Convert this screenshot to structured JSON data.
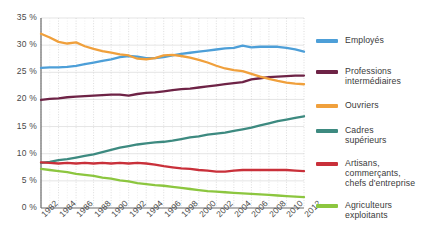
{
  "chart_data": {
    "type": "line",
    "title": "",
    "subtitle": "",
    "xlabel": "",
    "ylabel": "",
    "xlim": [
      1982,
      2012
    ],
    "ylim": [
      0,
      35
    ],
    "grid": true,
    "legend_position": "right",
    "y_ticks": [
      {
        "value": 0,
        "label": "0 %"
      },
      {
        "value": 5,
        "label": "5 %"
      },
      {
        "value": 10,
        "label": "10 %"
      },
      {
        "value": 15,
        "label": "15 %"
      },
      {
        "value": 20,
        "label": "20 %"
      },
      {
        "value": 25,
        "label": "25 %"
      },
      {
        "value": 30,
        "label": "30 %"
      },
      {
        "value": 35,
        "label": "35 %"
      }
    ],
    "x_ticks": [
      {
        "value": 1982,
        "label": "1982"
      },
      {
        "value": 1984,
        "label": "1984"
      },
      {
        "value": 1986,
        "label": "1986"
      },
      {
        "value": 1988,
        "label": "1988"
      },
      {
        "value": 1990,
        "label": "1990"
      },
      {
        "value": 1992,
        "label": "1992"
      },
      {
        "value": 1994,
        "label": "1994"
      },
      {
        "value": 1996,
        "label": "1996"
      },
      {
        "value": 1998,
        "label": "1998"
      },
      {
        "value": 2000,
        "label": "2000"
      },
      {
        "value": 2002,
        "label": "2002"
      },
      {
        "value": 2004,
        "label": "2004"
      },
      {
        "value": 2006,
        "label": "2006"
      },
      {
        "value": 2008,
        "label": "2008"
      },
      {
        "value": 2010,
        "label": "2010"
      },
      {
        "value": 2012,
        "label": "2012"
      }
    ],
    "x": [
      1982,
      1983,
      1984,
      1985,
      1986,
      1987,
      1988,
      1989,
      1990,
      1991,
      1992,
      1993,
      1994,
      1995,
      1996,
      1997,
      1998,
      1999,
      2000,
      2001,
      2002,
      2003,
      2004,
      2005,
      2006,
      2007,
      2008,
      2009,
      2010,
      2011,
      2012
    ],
    "series": [
      {
        "name": "Employés",
        "color": "#4d9fd8",
        "values": [
          25.8,
          25.9,
          25.9,
          26.0,
          26.2,
          26.5,
          26.8,
          27.1,
          27.4,
          27.8,
          28.0,
          27.9,
          27.6,
          27.6,
          27.8,
          28.1,
          28.4,
          28.6,
          28.8,
          29.0,
          29.2,
          29.4,
          29.5,
          29.9,
          29.6,
          29.7,
          29.7,
          29.7,
          29.5,
          29.2,
          28.8
        ]
      },
      {
        "name": "Professions\nintermédiaires",
        "color": "#6e2346",
        "values": [
          19.9,
          20.1,
          20.2,
          20.4,
          20.5,
          20.6,
          20.7,
          20.8,
          20.9,
          20.9,
          20.7,
          21.0,
          21.2,
          21.3,
          21.5,
          21.7,
          21.9,
          22.0,
          22.2,
          22.4,
          22.6,
          22.8,
          23.0,
          23.2,
          23.7,
          23.9,
          24.1,
          24.2,
          24.3,
          24.4,
          24.4
        ]
      },
      {
        "name": "Ouvriers",
        "color": "#f0a03c",
        "values": [
          32.1,
          31.4,
          30.6,
          30.3,
          30.5,
          29.8,
          29.3,
          28.9,
          28.6,
          28.3,
          28.1,
          27.5,
          27.4,
          27.6,
          28.1,
          28.2,
          28.0,
          27.7,
          27.3,
          26.8,
          26.2,
          25.7,
          25.4,
          25.2,
          24.7,
          24.2,
          23.8,
          23.4,
          23.1,
          22.9,
          22.8
        ]
      },
      {
        "name": "Cadres\nsupérieurs",
        "color": "#3d8a80",
        "values": [
          8.3,
          8.5,
          8.8,
          9.0,
          9.3,
          9.6,
          9.9,
          10.3,
          10.7,
          11.1,
          11.4,
          11.7,
          11.9,
          12.1,
          12.2,
          12.4,
          12.7,
          13.0,
          13.2,
          13.5,
          13.7,
          13.9,
          14.2,
          14.5,
          14.8,
          15.2,
          15.6,
          16.0,
          16.3,
          16.6,
          16.9
        ]
      },
      {
        "name": "Artisans,\ncommerçants,\nchefs d'entreprise",
        "color": "#c9303a",
        "values": [
          8.4,
          8.3,
          8.2,
          8.3,
          8.2,
          8.3,
          8.2,
          8.3,
          8.2,
          8.3,
          8.2,
          8.3,
          8.2,
          8.0,
          7.7,
          7.5,
          7.3,
          7.2,
          7.0,
          6.9,
          6.7,
          6.7,
          6.9,
          7.0,
          7.0,
          7.0,
          7.0,
          7.0,
          7.0,
          6.9,
          6.8
        ]
      },
      {
        "name": "Agriculteurs\nexploitants",
        "color": "#8cc63f",
        "values": [
          7.2,
          7.0,
          6.8,
          6.6,
          6.3,
          6.1,
          5.9,
          5.6,
          5.4,
          5.1,
          4.9,
          4.6,
          4.4,
          4.2,
          4.1,
          3.9,
          3.7,
          3.5,
          3.3,
          3.1,
          3.0,
          2.9,
          2.8,
          2.7,
          2.6,
          2.5,
          2.4,
          2.3,
          2.2,
          2.1,
          2.0
        ]
      }
    ]
  },
  "legend": {
    "items": [
      {
        "label": "Employés"
      },
      {
        "label": "Professions\nintermédiaires"
      },
      {
        "label": "Ouvriers"
      },
      {
        "label": "Cadres\nsupérieurs"
      },
      {
        "label": "Artisans,\ncommerçants,\nchefs d'entreprise"
      },
      {
        "label": "Agriculteurs\nexploitants"
      }
    ]
  }
}
